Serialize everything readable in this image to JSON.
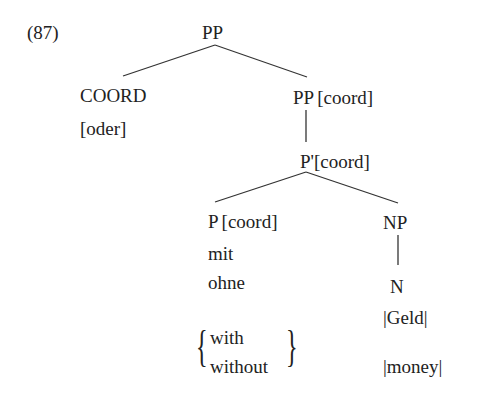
{
  "example_number": "(87)",
  "tree": {
    "root": {
      "label": "PP"
    },
    "coord": {
      "label": "COORD",
      "word": "[oder]"
    },
    "pp_coord": {
      "label": "PP",
      "feature": "[coord]"
    },
    "pbar_coord": {
      "label": "P'",
      "feature": "[coord]"
    },
    "p_coord": {
      "label": "P",
      "feature": "[coord]",
      "words": [
        "mit",
        "ohne"
      ],
      "glosses": [
        "with",
        "without"
      ]
    },
    "np": {
      "label": "NP"
    },
    "n": {
      "label": "N",
      "word": "|Geld|",
      "gloss": "|money|"
    }
  },
  "glyphs": {
    "left_brace": "{",
    "right_brace": "}"
  }
}
